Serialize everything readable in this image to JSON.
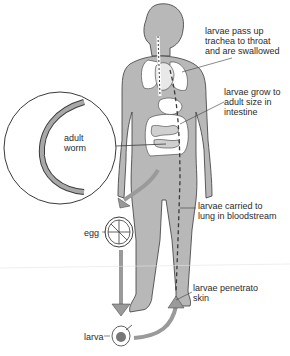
{
  "diagram": {
    "type": "life-cycle",
    "labels": {
      "trachea": "larvae pass up\ntrachea to throat\nand are swallowed",
      "intestine": "larvae grow to\nadult size in\nintestine",
      "adult_worm": "adult\nworm",
      "bloodstream": "larvae carried to\nlung in bloodstream",
      "egg": "egg",
      "skin": "larvae penetrato\nskin",
      "larva": "larva"
    },
    "stages": [
      "adult worm",
      "egg",
      "larva",
      "larvae penetrate skin",
      "larvae carried to lung in bloodstream",
      "larvae pass up trachea to throat and are swallowed",
      "larvae grow to adult size in intestine"
    ],
    "colors": {
      "body": "#b8b8b8",
      "outline": "#3a3a3a",
      "organs": "#ffffff",
      "arrow": "#9a9a9a"
    }
  }
}
